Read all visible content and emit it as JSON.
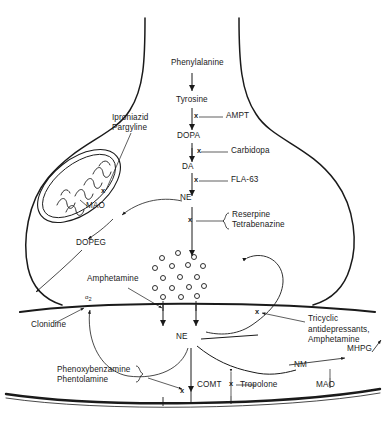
{
  "figure": {
    "background_color": "#ffffff",
    "ink_color": "#1a1a1a"
  },
  "pathway": {
    "label": "central-biosynthetic-pathway",
    "steps": [
      {
        "id": "phenylalanine",
        "text": "Phenylalanine"
      },
      {
        "id": "tyrosine",
        "text": "Tyrosine"
      },
      {
        "id": "dopa",
        "text": "DOPA"
      },
      {
        "id": "da",
        "text": "DA"
      },
      {
        "id": "ne_terminal",
        "text": "NE"
      }
    ]
  },
  "inhibitors": {
    "ampt": "AMPT",
    "carbidopa": "Carbidopa",
    "fla63": "FLA-63",
    "reserpine": "Reserpine",
    "tetrabenazine": "Tetrabenazine",
    "iproniazid": "Iproniazid",
    "pargyline": "Pargyline",
    "clonidine": "Clonidine",
    "tropolone": "Tropolone",
    "phenoxybenzamine": "Phenoxybenzamine",
    "phentolamine": "Phentolamine",
    "tricyclic_line1": "Tricyclic",
    "tricyclic_line2": "antidepressants,",
    "tricyclic_line3": "Amphetamine",
    "amphetamine": "Amphetamine"
  },
  "enzymes": {
    "mao_terminal": "MAO",
    "mao_postsynaptic": "MAO",
    "comt": "COMT"
  },
  "metabolites": {
    "dopeg": "DOPEG",
    "ne_cleft": "NE",
    "nm": "NM",
    "mhpg": "MHPG"
  },
  "receptors": {
    "alpha2_prefix": "α",
    "alpha2_subscript": "2"
  },
  "markers": {
    "block_symbol": "x"
  }
}
